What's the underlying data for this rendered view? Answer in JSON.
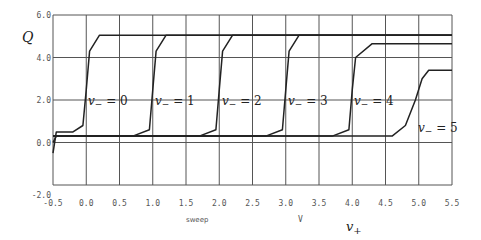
{
  "chart_data": {
    "type": "line",
    "title": "",
    "xlabel": "v+",
    "ylabel": "Q",
    "x_annotations": [
      "sweep",
      "V"
    ],
    "xlim": [
      -0.5,
      5.5
    ],
    "ylim": [
      -2.0,
      6.0
    ],
    "grid": true,
    "x_ticks": [
      "-0.5",
      "0.0",
      "0.5",
      "1.0",
      "1.5",
      "2.0",
      "2.5",
      "3.0",
      "3.5",
      "4.0",
      "4.5",
      "5.0",
      "5.5"
    ],
    "y_ticks": [
      "-2.0",
      "0.0",
      "2.0",
      "4.0",
      "6.0"
    ],
    "series": [
      {
        "name": "v- = 0",
        "label": "v₋ = 0",
        "step_x": 0.0,
        "low": 0.5,
        "high": 5.05,
        "x": [
          -0.5,
          -0.45,
          -0.2,
          -0.05,
          0.0,
          0.05,
          0.2,
          5.5
        ],
        "y": [
          -0.5,
          0.5,
          0.5,
          0.8,
          2.5,
          4.3,
          5.05,
          5.05
        ]
      },
      {
        "name": "v- = 1",
        "label": "v₋ = 1",
        "step_x": 1.0,
        "low": 0.3,
        "high": 5.05,
        "x": [
          -0.5,
          -0.45,
          0.7,
          0.95,
          1.0,
          1.05,
          1.2,
          5.5
        ],
        "y": [
          0.0,
          0.3,
          0.3,
          0.6,
          2.5,
          4.3,
          5.05,
          5.05
        ]
      },
      {
        "name": "v- = 2",
        "label": "v₋ = 2",
        "step_x": 2.0,
        "low": 0.3,
        "high": 5.05,
        "x": [
          -0.5,
          1.7,
          1.95,
          2.0,
          2.05,
          2.2,
          5.5
        ],
        "y": [
          0.3,
          0.3,
          0.6,
          2.5,
          4.3,
          5.05,
          5.05
        ]
      },
      {
        "name": "v- = 3",
        "label": "v₋ = 3",
        "step_x": 3.0,
        "low": 0.3,
        "high": 5.05,
        "x": [
          -0.5,
          2.7,
          2.95,
          3.0,
          3.05,
          3.2,
          5.5
        ],
        "y": [
          0.3,
          0.3,
          0.6,
          2.5,
          4.3,
          5.05,
          5.05
        ]
      },
      {
        "name": "v- = 4",
        "label": "v₋ = 4",
        "step_x": 4.0,
        "low": 0.3,
        "high": 4.65,
        "x": [
          -0.5,
          3.7,
          3.95,
          4.0,
          4.05,
          4.3,
          5.5
        ],
        "y": [
          0.3,
          0.3,
          0.6,
          2.5,
          4.0,
          4.65,
          4.65
        ]
      },
      {
        "name": "v- = 5",
        "label": "v₋ = 5",
        "step_x": 5.0,
        "low": 0.3,
        "high": 3.4,
        "x": [
          -0.5,
          4.6,
          4.8,
          4.95,
          5.05,
          5.15,
          5.5
        ],
        "y": [
          0.3,
          0.3,
          0.8,
          2.0,
          3.0,
          3.4,
          3.4
        ]
      }
    ]
  },
  "labels": {
    "y_axis": "Q",
    "x_axis": "v",
    "x_axis_sub": "+",
    "sweep": "sweep",
    "unit": "V",
    "curve_labels": [
      {
        "main": "v",
        "sub": "−",
        "rest": " = 0"
      },
      {
        "main": "v",
        "sub": "−",
        "rest": " = 1"
      },
      {
        "main": "v",
        "sub": "−",
        "rest": " = 2"
      },
      {
        "main": "v",
        "sub": "−",
        "rest": " = 3"
      },
      {
        "main": "v",
        "sub": "−",
        "rest": " = 4"
      },
      {
        "main": "v",
        "sub": "−",
        "rest": " = 5"
      }
    ]
  },
  "colors": {
    "line": "#222222",
    "grid": "#555555",
    "text": "#555555"
  }
}
